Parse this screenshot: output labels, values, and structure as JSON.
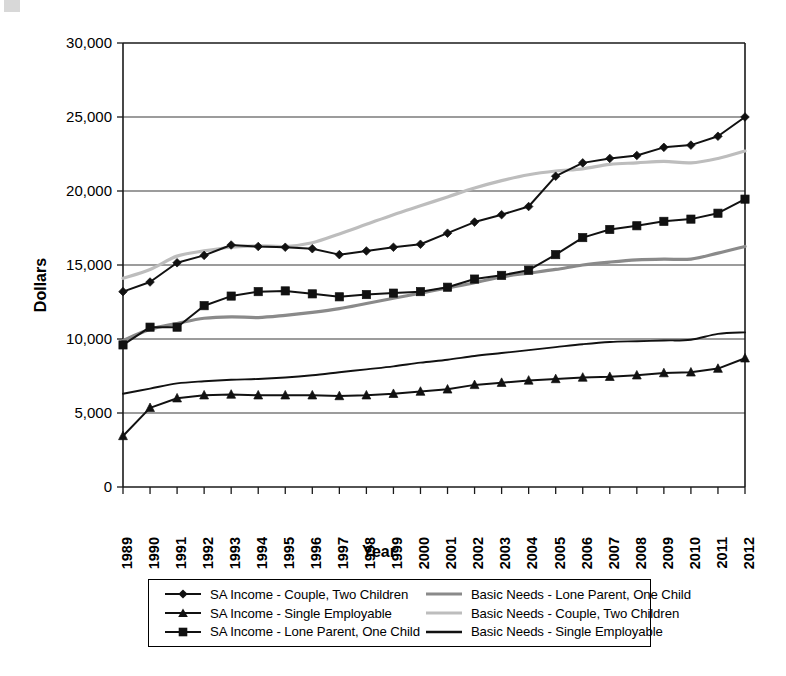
{
  "chart_data": {
    "type": "line",
    "title": "",
    "xlabel": "Year",
    "ylabel": "Dollars",
    "xlim": [
      1989,
      2012
    ],
    "ylim": [
      0,
      30000
    ],
    "ytick_labels": [
      "0",
      "5,000",
      "10,000",
      "15,000",
      "20,000",
      "25,000",
      "30,000"
    ],
    "ytick_values": [
      0,
      5000,
      10000,
      15000,
      20000,
      25000,
      30000
    ],
    "grid": "horizontal",
    "legend_position": "below-plot",
    "x": [
      1989,
      1990,
      1991,
      1992,
      1993,
      1994,
      1995,
      1996,
      1997,
      1998,
      1999,
      2000,
      2001,
      2002,
      2003,
      2004,
      2005,
      2006,
      2007,
      2008,
      2009,
      2010,
      2011,
      2012
    ],
    "categories": [
      "1989",
      "1990",
      "1991",
      "1992",
      "1993",
      "1994",
      "1995",
      "1996",
      "1997",
      "1998",
      "1999",
      "2000",
      "2001",
      "2002",
      "2003",
      "2004",
      "2005",
      "2006",
      "2007",
      "2008",
      "2009",
      "2010",
      "2011",
      "2012"
    ],
    "series": [
      {
        "name": "SA Income - Couple, Two Children",
        "marker": "diamond",
        "color": "#111111",
        "style": "marker-line",
        "values": [
          13200,
          13850,
          15150,
          15650,
          16350,
          16250,
          16200,
          16100,
          15700,
          15950,
          16200,
          16400,
          17150,
          17900,
          18400,
          18950,
          21000,
          21900,
          22200,
          22400,
          22950,
          23100,
          23700,
          25000
        ]
      },
      {
        "name": "SA Income - Single Employable",
        "marker": "triangle",
        "color": "#111111",
        "style": "marker-line",
        "values": [
          3450,
          5350,
          6000,
          6200,
          6250,
          6200,
          6200,
          6200,
          6150,
          6200,
          6300,
          6450,
          6600,
          6900,
          7050,
          7200,
          7300,
          7400,
          7450,
          7550,
          7700,
          7750,
          8000,
          8700
        ]
      },
      {
        "name": "SA Income - Lone Parent, One Child",
        "marker": "square",
        "color": "#111111",
        "style": "marker-line",
        "values": [
          9600,
          10800,
          10800,
          12250,
          12900,
          13200,
          13250,
          13050,
          12850,
          13000,
          13100,
          13200,
          13500,
          14050,
          14300,
          14650,
          15700,
          16850,
          17400,
          17650,
          17950,
          18100,
          18500,
          19450
        ]
      },
      {
        "name": "Basic Needs - Lone Parent, One Child",
        "marker": "none",
        "color": "#8a8a8a",
        "style": "thick-line",
        "values": [
          9900,
          10650,
          11050,
          11400,
          11500,
          11450,
          11600,
          11800,
          12050,
          12400,
          12750,
          13100,
          13450,
          13800,
          14200,
          14450,
          14700,
          15000,
          15200,
          15350,
          15400,
          15400,
          15800,
          16250
        ]
      },
      {
        "name": "Basic Needs - Couple, Two Children",
        "marker": "none",
        "color": "#bdbdbd",
        "style": "thick-line",
        "values": [
          14100,
          14700,
          15600,
          15950,
          16200,
          16300,
          16250,
          16500,
          17100,
          17750,
          18400,
          19000,
          19600,
          20200,
          20700,
          21100,
          21350,
          21500,
          21800,
          21900,
          22000,
          21900,
          22200,
          22700
        ]
      },
      {
        "name": "Basic Needs - Single Employable",
        "marker": "none",
        "color": "#111111",
        "style": "thin-line",
        "values": [
          6300,
          6650,
          7000,
          7150,
          7250,
          7300,
          7400,
          7550,
          7750,
          7950,
          8150,
          8400,
          8600,
          8850,
          9050,
          9250,
          9450,
          9650,
          9800,
          9850,
          9900,
          9950,
          10350,
          10450
        ]
      }
    ]
  },
  "axes": {
    "ylabel": "Dollars",
    "xlabel": "Year"
  },
  "legend": {
    "left_column": [
      {
        "label": "SA Income - Couple, Two Children",
        "marker": "diamond",
        "color": "#111111"
      },
      {
        "label": "SA Income - Single Employable",
        "marker": "triangle",
        "color": "#111111"
      },
      {
        "label": "SA Income - Lone Parent, One Child",
        "marker": "square",
        "color": "#111111"
      }
    ],
    "right_column": [
      {
        "label": "Basic Needs - Lone Parent, One Child",
        "marker": "none",
        "color": "#8a8a8a"
      },
      {
        "label": "Basic Needs - Couple, Two Children",
        "marker": "none",
        "color": "#bdbdbd"
      },
      {
        "label": "Basic Needs - Single Employable",
        "marker": "none",
        "color": "#111111"
      }
    ]
  }
}
